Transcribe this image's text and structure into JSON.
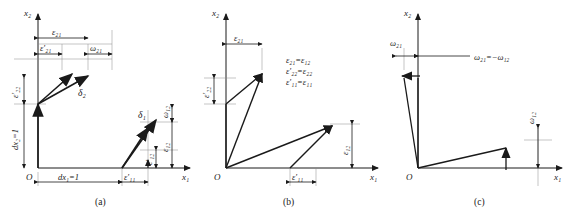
{
  "figure": {
    "background": "#ffffff",
    "ink": "#1a1a1a",
    "panel_count": 3
  },
  "panels": [
    {
      "id": "a",
      "caption": "(a)",
      "axes": {
        "x_label": "x₁",
        "y_label": "x₂",
        "origin_label": "O"
      },
      "dimension_labels": {
        "top_outer": "ε₂₁",
        "top_inner": "ε′₂₁",
        "top_right": "ω₂₁",
        "left_upper": "ε′₂₂",
        "left_lower": "dx₂=1",
        "bottom_left": "dx₁=1",
        "bottom_mid": "ε′₁₁",
        "right_upper": "ω₁₂",
        "right_lower": "ε₁₂",
        "right_inner": "ε′₁₂"
      },
      "vectors": [
        {
          "name": "delta-2",
          "label": "δ₂"
        },
        {
          "name": "delta-1",
          "label": "δ₁"
        }
      ]
    },
    {
      "id": "b",
      "caption": "(b)",
      "axes": {
        "x_label": "x₁",
        "y_label": "x₂",
        "origin_label": "O"
      },
      "dimension_labels": {
        "top": "ε₂₁",
        "left": "ε′₂₂",
        "bottom": "ε′₁₁",
        "right": "ε₁₂"
      },
      "equations": [
        "ε₂₁=ε₁₂",
        "ε′₂₂=ε₂₂",
        "ε′₁₁=ε₁₁"
      ]
    },
    {
      "id": "c",
      "caption": "(c)",
      "axes": {
        "x_label": "x₁",
        "y_label": "x₂",
        "origin_label": "O"
      },
      "dimension_labels": {
        "top_left": "ω₂₁",
        "right": "ω₁₂"
      },
      "equations": [
        "ω₂₁=−ω₁₂"
      ]
    }
  ]
}
